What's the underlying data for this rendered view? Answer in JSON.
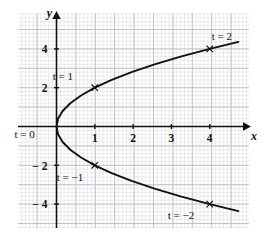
{
  "figure": {
    "background_color": "#ffffff",
    "grid_minor_color": "#d8d8dc",
    "grid_major_color": "#b9b9c0",
    "axis_color": "#101010",
    "curve_color": "#101010"
  },
  "axes": {
    "x_name": "x",
    "y_name": "y",
    "x_ticks": [
      {
        "value": 1,
        "label": "1"
      },
      {
        "value": 2,
        "label": "2"
      },
      {
        "value": 3,
        "label": "3"
      },
      {
        "value": 4,
        "label": "4"
      }
    ],
    "y_ticks": [
      {
        "value": 4,
        "label": "4"
      },
      {
        "value": 2,
        "label": "2"
      },
      {
        "value": -2,
        "label": "− 2"
      },
      {
        "value": -4,
        "label": "− 4"
      }
    ],
    "xlim": [
      -1.0,
      5.05
    ],
    "ylim": [
      -5.85,
      5.85
    ],
    "grid": true
  },
  "chart_data": {
    "type": "line",
    "title": "",
    "xlabel": "x",
    "ylabel": "y",
    "xlim": [
      -1.0,
      5.05
    ],
    "ylim": [
      -5.85,
      5.85
    ],
    "grid": true,
    "legend": "none",
    "curve": {
      "name": "parametric-parabola",
      "equations": {
        "x": "t^2",
        "y": "2t"
      },
      "t_range": [
        -2.18,
        2.18
      ],
      "points_x": [
        4.75,
        4.0,
        3.24,
        2.56,
        1.96,
        1.44,
        1.0,
        0.64,
        0.36,
        0.16,
        0.04,
        0.0,
        0.04,
        0.16,
        0.36,
        0.64,
        1.0,
        1.44,
        1.96,
        2.56,
        3.24,
        4.0,
        4.75
      ],
      "points_y": [
        -4.36,
        -4.0,
        -3.6,
        -3.2,
        -2.8,
        -2.4,
        -2.0,
        -1.6,
        -1.2,
        -0.8,
        -0.4,
        0.0,
        0.4,
        0.8,
        1.2,
        1.6,
        2.0,
        2.4,
        2.8,
        3.2,
        3.6,
        4.0,
        4.36
      ]
    },
    "marked_points": [
      {
        "t": 2,
        "x": 4,
        "y": 4,
        "label": "t = 2",
        "label_dx": 2,
        "label_dy": -9
      },
      {
        "t": 1,
        "x": 1,
        "y": 2,
        "label": "t = 1",
        "label_dx": -42,
        "label_dy": -8
      },
      {
        "t": 0,
        "x": 0,
        "y": 0,
        "label": "t = 0",
        "label_dx": -42,
        "label_dy": 11
      },
      {
        "t": -1,
        "x": 1,
        "y": -2,
        "label": "t = −1",
        "label_dx": -38,
        "label_dy": 16
      },
      {
        "t": -2,
        "x": 4,
        "y": -4,
        "label": "t = −2",
        "label_dx": -42,
        "label_dy": 15
      }
    ]
  }
}
